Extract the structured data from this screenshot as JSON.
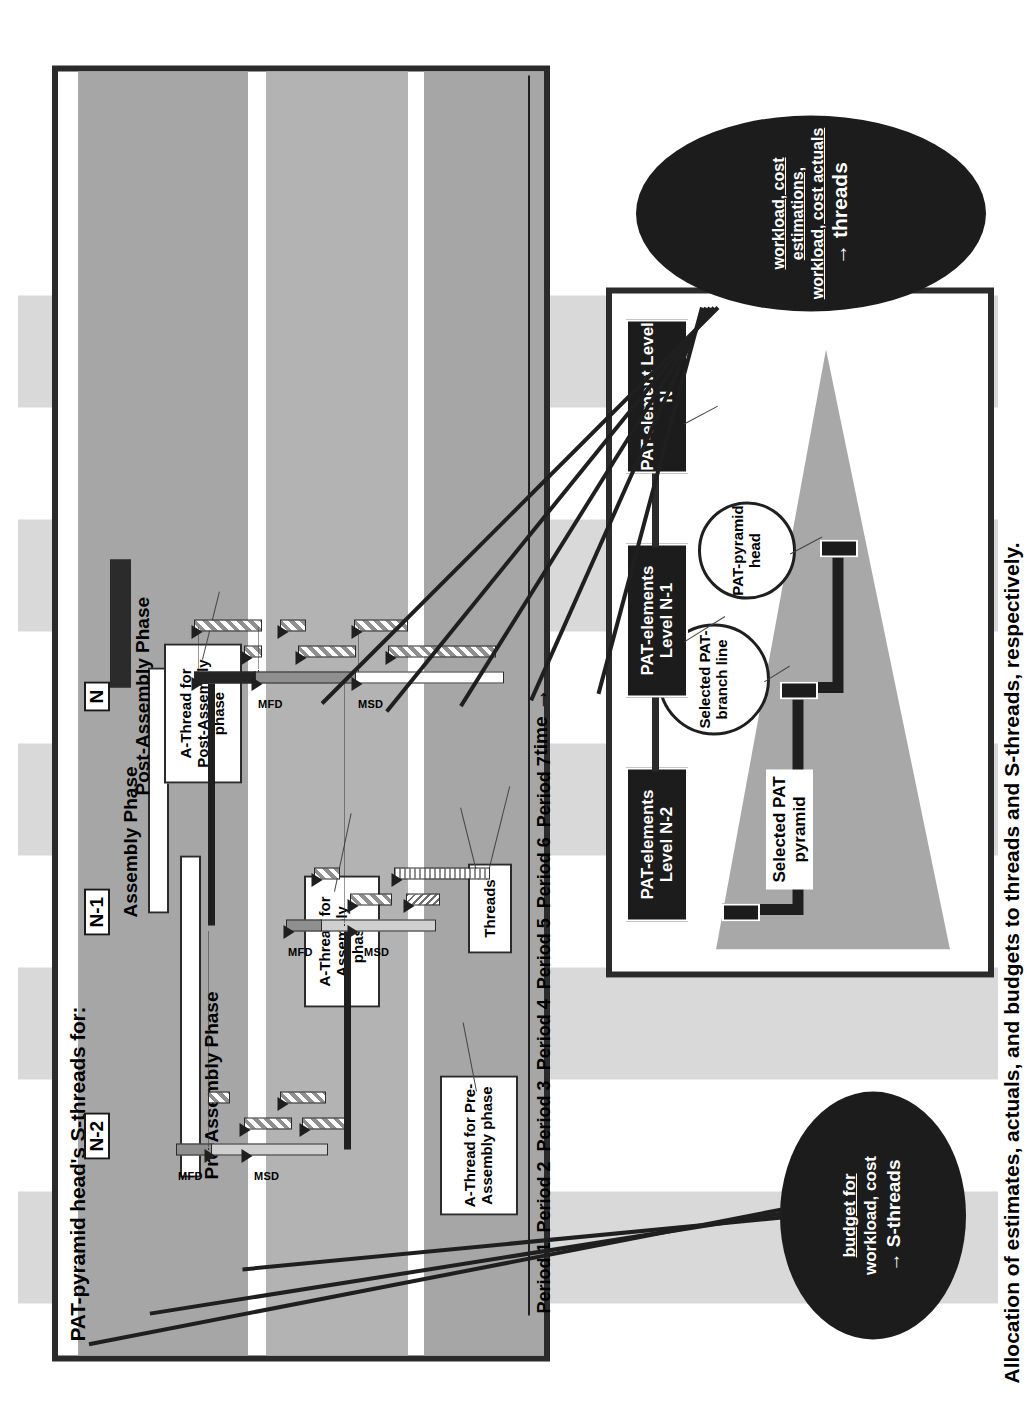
{
  "figure": {
    "caption": "Allocation of estimates, actuals, and budgets to threads and S-threads, respectively."
  },
  "gantt_panel": {
    "title": "PAT-pyramid head's S-threads for:",
    "phase_labels": [
      "Pre-Assembly Phase",
      "Assembly Phase",
      "Post-Assembly Phase"
    ],
    "level_tags": [
      "N-2",
      "N-1",
      "N"
    ],
    "notes": [
      "A-Thread for Pre-Assembly phase",
      "A-Thread for Assembly phase",
      "A-Thread for Post-Assembly phase",
      "Threads"
    ],
    "milestone_labels": {
      "msd": "MSD",
      "mfd": "MFD"
    },
    "axis": {
      "periods": [
        "Period 1",
        "Period 2",
        "Period 3",
        "Period 4",
        "Period 5",
        "Period 6",
        "Period 7"
      ],
      "time_label": "time",
      "time_arrow": "→"
    }
  },
  "pyramid_panel": {
    "elements": [
      "PAT-elements Level N-2",
      "PAT-elements Level N-1",
      "PAT-element Level N"
    ],
    "pyramid_label": "Selected PAT pyramid",
    "callouts": [
      "Selected PAT-branch line",
      "PAT-pyramid head"
    ]
  },
  "ellipses": {
    "budget": {
      "line1": "budget for",
      "line2": "workload, cost",
      "line3": "→ S-threads"
    },
    "threads": {
      "line1": "workload, cost estimations,",
      "line2": "workload, cost actuals",
      "line3": "→ threads"
    }
  },
  "colors": {
    "band_light": "#d9d9d9",
    "band_mid": "#b3b3b3",
    "band_dark": "#a6a6a6",
    "ink": "#2b2b2b",
    "ellipse_fill": "#1c1c1c",
    "pyramid_fill": "#a8a8a8"
  }
}
